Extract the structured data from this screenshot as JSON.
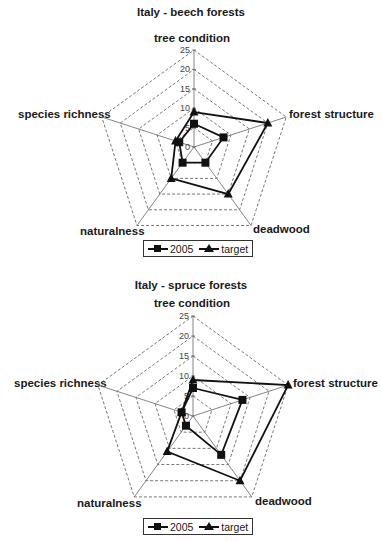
{
  "chart_data": [
    {
      "type": "radar",
      "title": "Italy - beech forests",
      "categories": [
        "tree condition",
        "forest structure",
        "deadwood",
        "naturalness",
        "species richness"
      ],
      "series": [
        {
          "name": "2005",
          "marker": "square",
          "values": [
            6,
            8,
            5,
            5,
            4
          ]
        },
        {
          "name": "target",
          "marker": "triangle",
          "values": [
            9,
            20,
            15,
            10,
            5
          ]
        }
      ],
      "radial_ticks": [
        0,
        5,
        10,
        15,
        20,
        25
      ],
      "rlim": [
        0,
        25
      ],
      "grid": "dashed",
      "legend_position": "bottom"
    },
    {
      "type": "radar",
      "title": "Italy - spruce forests",
      "categories": [
        "tree condition",
        "forest structure",
        "deadwood",
        "naturalness",
        "species richness"
      ],
      "series": [
        {
          "name": "2005",
          "marker": "square",
          "values": [
            7,
            13,
            12,
            3,
            3
          ]
        },
        {
          "name": "target",
          "marker": "triangle",
          "values": [
            9,
            25,
            20,
            11,
            3
          ]
        }
      ],
      "radial_ticks": [
        0,
        5,
        10,
        15,
        20,
        25
      ],
      "rlim": [
        0,
        25
      ],
      "grid": "dashed",
      "legend_position": "bottom"
    }
  ],
  "charts": [
    {
      "title": "Italy - beech forests",
      "labels": {
        "tree_condition": "tree condition",
        "forest_structure": "forest structure",
        "deadwood": "deadwood",
        "naturalness": "naturalness",
        "species_richness": "species richness"
      },
      "legend": {
        "s1": "2005",
        "s2": "target"
      }
    },
    {
      "title": "Italy - spruce forests",
      "labels": {
        "tree_condition": "tree condition",
        "forest_structure": "forest structure",
        "deadwood": "deadwood",
        "naturalness": "naturalness",
        "species_richness": "species richness"
      },
      "legend": {
        "s1": "2005",
        "s2": "target"
      }
    }
  ],
  "colors": {
    "line": "#111111",
    "grid": "#555555",
    "axis": "#666666",
    "text": "#1a1a1a"
  }
}
